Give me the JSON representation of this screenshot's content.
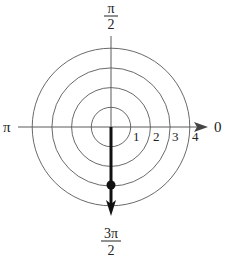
{
  "diagram": {
    "type": "polar-grid",
    "center": {
      "x": 111,
      "y": 127
    },
    "unit_px": 19.7,
    "circles": [
      1,
      2,
      3,
      4
    ],
    "ring_labels": [
      "1",
      "2",
      "3",
      "4"
    ],
    "angle_labels": {
      "right": "0",
      "left": "π",
      "top_num": "π",
      "top_den": "2",
      "bottom_num": "3π",
      "bottom_den": "2"
    },
    "point": {
      "r": 3,
      "theta": "3π/2"
    },
    "colors": {
      "grid": "#666666",
      "axis": "#555555",
      "ray": "#111111",
      "text": "#222222"
    }
  }
}
